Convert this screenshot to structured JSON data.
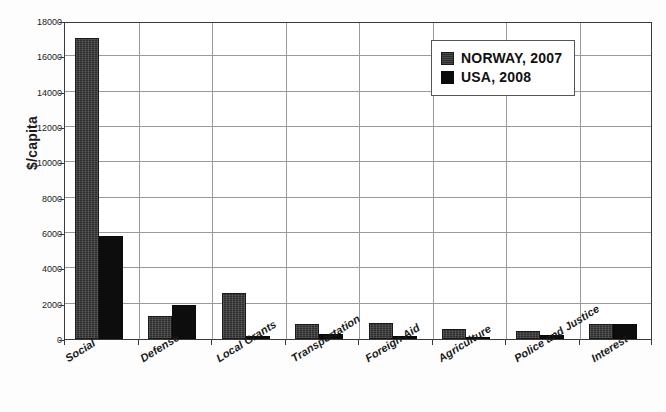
{
  "chart_data": {
    "type": "bar",
    "title": "",
    "xlabel": "",
    "ylabel": "$/capita",
    "ylim": [
      0,
      18000
    ],
    "ytick_step": 2000,
    "yticks": [
      0,
      2000,
      4000,
      6000,
      8000,
      10000,
      12000,
      14000,
      16000,
      18000
    ],
    "ytick_labels": [
      "0",
      "2000",
      "4000",
      "6000",
      "8000",
      "10000",
      "12000",
      "14000",
      "16000",
      "18000"
    ],
    "grid": "horizontal-and-vertical",
    "legend_position": "upper-right",
    "categories": [
      "Social",
      "Defense",
      "Local Grants",
      "Transportation",
      "Foreign Aid",
      "Agriculture",
      "Police and Justice",
      "Interest"
    ],
    "series": [
      {
        "name": "NORWAY, 2007",
        "color": "#2e2e2e",
        "values": [
          17050,
          1300,
          2600,
          850,
          900,
          550,
          450,
          850
        ]
      },
      {
        "name": "USA, 2008",
        "color": "#0d0d0d",
        "values": [
          5850,
          1900,
          150,
          280,
          170,
          130,
          200,
          870
        ]
      }
    ]
  },
  "legend": {
    "items": [
      {
        "label": "NORWAY, 2007",
        "swatch": "norway"
      },
      {
        "label": "USA, 2008",
        "swatch": "usa"
      }
    ]
  }
}
